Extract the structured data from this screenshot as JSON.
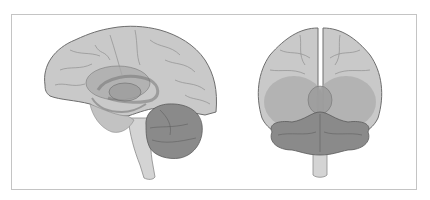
{
  "figure": {
    "views": [
      {
        "id": "lateral",
        "label": "Lateral (sagittal) view"
      },
      {
        "id": "posterior",
        "label": "Posterior (coronal) view"
      }
    ],
    "colors": {
      "background": "#ffffff",
      "frame": "#c4c4c4",
      "cerebrum_fill": "#c9c9c9",
      "cerebrum_stroke": "#6e6e6e",
      "inner_structures": "#a9a9a9",
      "cerebellum_fill": "#8a8a8a",
      "brainstem_fill": "#d2d2d2",
      "sulci": "#8f8f8f"
    }
  }
}
